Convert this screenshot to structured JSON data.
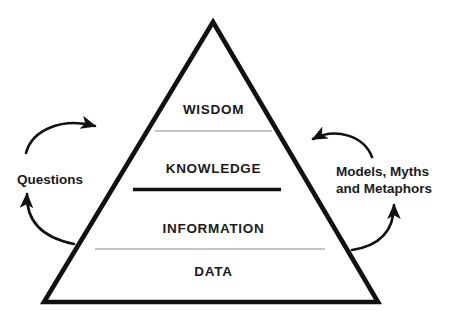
{
  "diagram": {
    "colors": {
      "stroke": "#111111",
      "thin_divider": "#8a8a8a",
      "thick_divider": "#111111",
      "text": "#1b1b1b",
      "background": "#ffffff"
    },
    "pyramid": {
      "apex": [
        213,
        22
      ],
      "base_left": [
        44,
        302
      ],
      "base_right": [
        378,
        302
      ],
      "stroke_width": 4.6
    },
    "tiers": [
      {
        "id": "wisdom",
        "label": "WISDOM",
        "level": 1,
        "center_x": 213,
        "text_y": 110
      },
      {
        "id": "knowledge",
        "label": "KNOWLEDGE",
        "level": 2,
        "center_x": 213,
        "text_y": 169
      },
      {
        "id": "information",
        "label": "INFORMATION",
        "level": 3,
        "center_x": 213,
        "text_y": 229
      },
      {
        "id": "data",
        "label": "DATA",
        "level": 4,
        "center_x": 213,
        "text_y": 272
      }
    ],
    "dividers": [
      {
        "id": "wisdom-knowledge-divider",
        "y": 131,
        "x1": 155,
        "x2": 272,
        "weight": "thin",
        "thickness": 1.1
      },
      {
        "id": "knowledge-information-divider",
        "y": 189,
        "x1": 133,
        "x2": 281,
        "weight": "thick",
        "thickness": 3.4
      },
      {
        "id": "information-data-divider",
        "y": 249,
        "x1": 95,
        "x2": 325,
        "weight": "thin",
        "thickness": 1.1
      }
    ],
    "annotations": {
      "left": {
        "id": "questions",
        "label": "Questions",
        "lines": [
          "Questions"
        ],
        "arrow_top": {
          "direction": "right-into-pyramid",
          "from": [
            26,
            152
          ],
          "to": [
            97,
            126
          ]
        },
        "arrow_bottom": {
          "direction": "up-left-out",
          "from": [
            73,
            243
          ],
          "to": [
            27,
            191
          ]
        }
      },
      "right": {
        "id": "models-myths-metaphors",
        "label": "Models, Myths and Metaphors",
        "lines": [
          "Models, Myths",
          "and Metaphors"
        ],
        "arrow_top": {
          "direction": "left-into-pyramid",
          "from": [
            371,
            156
          ],
          "to": [
            311,
            139
          ]
        },
        "arrow_bottom": {
          "direction": "up-right-out",
          "from": [
            352,
            249
          ],
          "to": [
            395,
            202
          ]
        }
      }
    },
    "icons": {
      "arrow_top_left": "curved-arrow-icon",
      "arrow_bottom_left": "curved-arrow-icon",
      "arrow_top_right": "curved-arrow-icon",
      "arrow_bottom_right": "curved-arrow-icon"
    }
  }
}
